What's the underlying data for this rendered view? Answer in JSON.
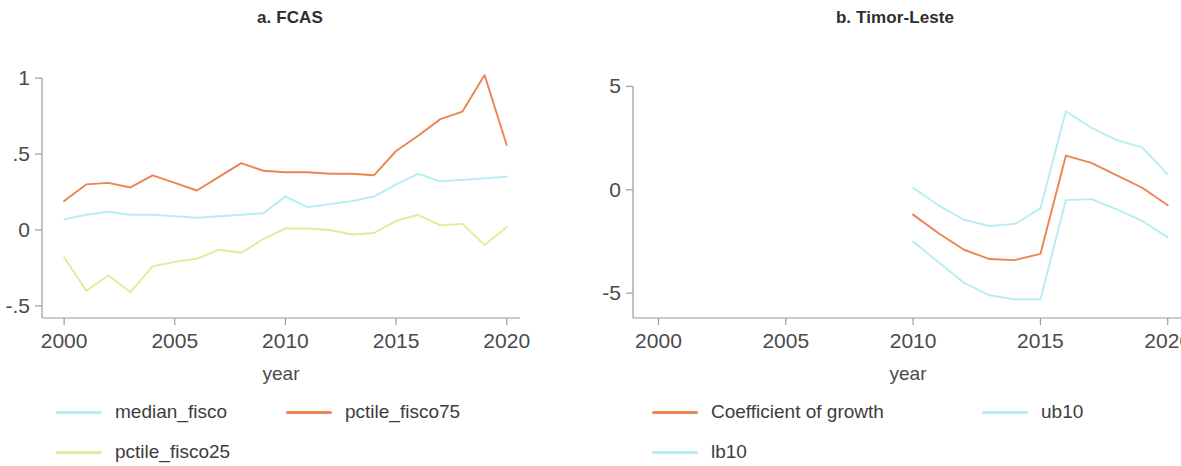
{
  "figure": {
    "background": "#ffffff",
    "colors": {
      "orange": "#eb8552",
      "cyan": "#b4eef2",
      "green": "#d9ef9a",
      "axis": "#9a9a9a",
      "text": "#3d3d3d"
    }
  },
  "panels": [
    {
      "id": "fcas",
      "title": "a. FCAS",
      "xlabel": "year",
      "legend": [
        {
          "label": "median_fisco",
          "color": "#b4eef2",
          "icon": "line-swatch"
        },
        {
          "label": "pctile_fisco75",
          "color": "#eb8552",
          "icon": "line-swatch"
        },
        {
          "label": "pctile_fisco25",
          "color": "#d9ef9a",
          "icon": "line-swatch"
        }
      ]
    },
    {
      "id": "timor-leste",
      "title": "b. Timor-Leste",
      "xlabel": "year",
      "legend": [
        {
          "label": "Coefficient of growth",
          "color": "#eb8552",
          "icon": "line-swatch"
        },
        {
          "label": "ub10",
          "color": "#b4eef2",
          "icon": "line-swatch"
        },
        {
          "label": "lb10",
          "color": "#b4eef2",
          "icon": "line-swatch"
        }
      ]
    }
  ],
  "chart_data": [
    {
      "type": "line",
      "title": "a. FCAS",
      "xlabel": "year",
      "ylabel": "",
      "xlim": [
        1999,
        2020.6
      ],
      "ylim": [
        -0.58,
        1.08
      ],
      "xticks": [
        2000,
        2005,
        2010,
        2015,
        2020
      ],
      "xticklabels": [
        "2000",
        "2005",
        "2010",
        "2015",
        "2020"
      ],
      "yticks": [
        -0.5,
        0,
        0.5,
        1
      ],
      "yticklabels": [
        "-.5",
        "0",
        ".5",
        "1"
      ],
      "grid": false,
      "legend_position": "bottom-left",
      "x": [
        2000,
        2001,
        2002,
        2003,
        2004,
        2005,
        2006,
        2007,
        2008,
        2009,
        2010,
        2011,
        2012,
        2013,
        2014,
        2015,
        2016,
        2017,
        2018,
        2019,
        2020
      ],
      "series": [
        {
          "name": "median_fisco",
          "color": "#b4eef2",
          "values": [
            0.07,
            0.1,
            0.12,
            0.1,
            0.1,
            0.09,
            0.08,
            0.09,
            0.1,
            0.11,
            0.22,
            0.15,
            0.17,
            0.19,
            0.22,
            0.3,
            0.37,
            0.32,
            0.33,
            0.34,
            0.35
          ]
        },
        {
          "name": "pctile_fisco75",
          "color": "#eb8552",
          "values": [
            0.19,
            0.3,
            0.31,
            0.28,
            0.36,
            0.31,
            0.26,
            0.35,
            0.44,
            0.39,
            0.38,
            0.38,
            0.37,
            0.37,
            0.36,
            0.52,
            0.62,
            0.73,
            0.78,
            1.02,
            0.56
          ]
        },
        {
          "name": "pctile_fisco25",
          "color": "#d9ef9a",
          "values": [
            -0.18,
            -0.4,
            -0.3,
            -0.41,
            -0.24,
            -0.21,
            -0.19,
            -0.13,
            -0.15,
            -0.06,
            0.01,
            0.01,
            0.0,
            -0.03,
            -0.02,
            0.06,
            0.1,
            0.03,
            0.04,
            -0.1,
            0.02
          ]
        }
      ]
    },
    {
      "type": "line",
      "title": "b. Timor-Leste",
      "xlabel": "year",
      "ylabel": "",
      "xlim": [
        1999,
        2020.6
      ],
      "ylim": [
        -6.2,
        5.6
      ],
      "xticks": [
        2000,
        2005,
        2010,
        2015,
        2020
      ],
      "xticklabels": [
        "2000",
        "2005",
        "2010",
        "2015",
        "2020"
      ],
      "yticks": [
        -5,
        0,
        5
      ],
      "yticklabels": [
        "-5",
        "0",
        "5"
      ],
      "grid": false,
      "legend_position": "bottom-left",
      "x": [
        2010,
        2011,
        2012,
        2013,
        2014,
        2015,
        2016,
        2017,
        2018,
        2019,
        2020
      ],
      "series": [
        {
          "name": "Coefficient of growth",
          "color": "#eb8552",
          "values": [
            -1.2,
            -2.1,
            -2.9,
            -3.35,
            -3.4,
            -3.1,
            1.65,
            1.3,
            0.7,
            0.1,
            -0.75
          ]
        },
        {
          "name": "ub10",
          "color": "#b4eef2",
          "values": [
            0.1,
            -0.75,
            -1.45,
            -1.75,
            -1.65,
            -0.9,
            3.8,
            3.0,
            2.4,
            2.05,
            0.75
          ]
        },
        {
          "name": "lb10",
          "color": "#b4eef2",
          "values": [
            -2.5,
            -3.5,
            -4.5,
            -5.1,
            -5.3,
            -5.3,
            -0.5,
            -0.45,
            -0.95,
            -1.5,
            -2.3
          ]
        }
      ]
    }
  ]
}
